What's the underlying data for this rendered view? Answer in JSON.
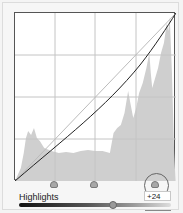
{
  "panel": {
    "region_label": "Highlights",
    "value": "+24",
    "slider_position_pct": 60
  },
  "graph": {
    "grid_divisions": 4,
    "split_points": [
      25,
      50,
      75
    ],
    "active_split_point": 75,
    "histogram_color": "#c8c8c8",
    "curve_color": "#222222",
    "baseline_color": "#bbbbbb"
  },
  "icons": {
    "split_point": "triangle-handle",
    "active_indicator": "circle-highlight",
    "slider_thumb": "round-knob"
  }
}
